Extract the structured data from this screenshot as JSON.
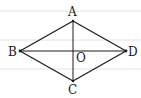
{
  "diagram": {
    "type": "geometry",
    "shape": "rhombus",
    "background_rules_y": [
      11,
      40,
      69
    ],
    "points": {
      "A": {
        "x": 73,
        "y": 21
      },
      "B": {
        "x": 20,
        "y": 51
      },
      "C": {
        "x": 73,
        "y": 81
      },
      "D": {
        "x": 126,
        "y": 51
      },
      "O": {
        "x": 73,
        "y": 51
      }
    },
    "labels": {
      "A": "A",
      "B": "B",
      "C": "C",
      "D": "D",
      "O": "O"
    },
    "edges": [
      "AB",
      "BC",
      "CD",
      "DA"
    ],
    "diagonals": [
      "AC",
      "BD"
    ],
    "colors": {
      "line": "#1a1a1a",
      "rule": "#e4e4e4",
      "background": "#ffffff"
    }
  }
}
